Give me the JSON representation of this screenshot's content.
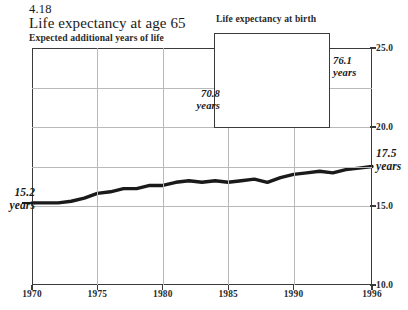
{
  "figure": {
    "number": "4.18",
    "title": "Life expectancy at age 65",
    "subtitle": "Expected additional years of life"
  },
  "inset": {
    "title": "Life expectancy at birth"
  },
  "callouts": {
    "main_start_value": "15.2",
    "main_start_unit": "years",
    "main_end_value": "17.5",
    "main_end_unit": "years",
    "inset_start_value": "70.8",
    "inset_start_unit": "years",
    "inset_end_value": "76.1",
    "inset_end_unit": "years"
  },
  "colors": {
    "line": "#1a1a1a",
    "frame": "#3a3a3a",
    "grid": "#b9b9b9",
    "background": "#ffffff"
  },
  "chart_data": {
    "type": "line",
    "title": "Life expectancy at age 65",
    "subtitle": "Expected additional years of life",
    "xlabel": "",
    "ylabel": "Expected additional years of life",
    "xlim": [
      1970,
      1996
    ],
    "ylim": [
      10.0,
      25.0
    ],
    "yticks": [
      "25.0",
      "20.0",
      "15.0",
      "10.0"
    ],
    "ytick_values": [
      25.0,
      20.0,
      15.0,
      10.0
    ],
    "ygrid_values": [
      25.0,
      22.5,
      20.0,
      17.5,
      15.0
    ],
    "xticks": [
      "1970",
      "1975",
      "1980",
      "1985",
      "1990",
      "1996"
    ],
    "xtick_values": [
      1970,
      1975,
      1980,
      1985,
      1990,
      1996
    ],
    "xgrid_values": [
      1975,
      1980,
      1985,
      1990,
      1996
    ],
    "grid": true,
    "legend": false,
    "y_axis_position": "right",
    "annotations": [
      {
        "text": "15.2 years",
        "x": 1970,
        "y": 15.2,
        "position": "left"
      },
      {
        "text": "17.5 years",
        "x": 1996,
        "y": 17.5,
        "position": "right"
      }
    ],
    "series": [
      {
        "name": "Life expectancy at age 65",
        "x": [
          1970,
          1971,
          1972,
          1973,
          1974,
          1975,
          1976,
          1977,
          1978,
          1979,
          1980,
          1981,
          1982,
          1983,
          1984,
          1985,
          1986,
          1987,
          1988,
          1989,
          1990,
          1991,
          1992,
          1993,
          1994,
          1995,
          1996
        ],
        "values": [
          15.2,
          15.2,
          15.2,
          15.3,
          15.5,
          15.8,
          15.9,
          16.1,
          16.1,
          16.3,
          16.3,
          16.5,
          16.6,
          16.5,
          16.6,
          16.5,
          16.6,
          16.7,
          16.5,
          16.8,
          17.0,
          17.1,
          17.2,
          17.1,
          17.3,
          17.4,
          17.5
        ]
      }
    ],
    "inset": {
      "type": "line",
      "title": "Life expectancy at birth",
      "xlim": [
        1970,
        1996
      ],
      "ylim": [
        69.5,
        77.0
      ],
      "xticks": [
        "1970",
        "1996"
      ],
      "xtick_values": [
        1970,
        1996
      ],
      "grid": false,
      "legend": false,
      "annotations": [
        {
          "text": "70.8 years",
          "x": 1970,
          "y": 70.8,
          "position": "left"
        },
        {
          "text": "76.1 years",
          "x": 1996,
          "y": 76.1,
          "position": "right"
        }
      ],
      "series": [
        {
          "name": "Life expectancy at birth",
          "x": [
            1970,
            1971,
            1972,
            1973,
            1974,
            1975,
            1976,
            1977,
            1978,
            1979,
            1980,
            1981,
            1982,
            1983,
            1984,
            1985,
            1986,
            1987,
            1988,
            1989,
            1990,
            1991,
            1992,
            1993,
            1994,
            1995,
            1996
          ],
          "values": [
            70.8,
            71.1,
            71.2,
            71.4,
            72.0,
            72.6,
            72.9,
            73.3,
            73.5,
            73.9,
            73.7,
            74.1,
            74.5,
            74.6,
            74.7,
            74.7,
            74.7,
            74.9,
            74.9,
            75.1,
            75.4,
            75.5,
            75.8,
            75.5,
            75.7,
            75.8,
            76.1
          ]
        }
      ]
    }
  }
}
